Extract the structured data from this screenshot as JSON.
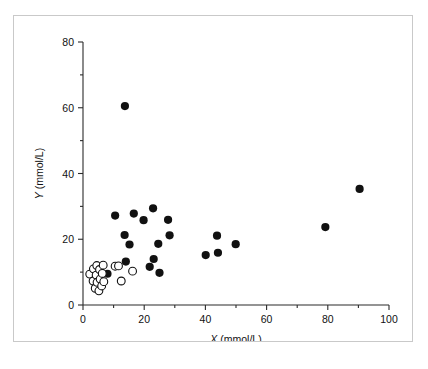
{
  "figure": {
    "border_color": "#c9c9c9",
    "background": "#ffffff"
  },
  "chart_data": {
    "type": "scatter",
    "title": "",
    "xlabel": "X (mmol/L)",
    "ylabel": "Y (mmol/L)",
    "xlabel_var": "X",
    "xlabel_unit": " (mmol/L)",
    "ylabel_var": "Y",
    "ylabel_unit": " (mmol/L)",
    "xlim": [
      0,
      100
    ],
    "ylim": [
      0,
      80
    ],
    "xticks": [
      0,
      20,
      40,
      60,
      80,
      100
    ],
    "yticks": [
      0,
      20,
      40,
      60,
      80
    ],
    "xtick_labels": [
      "0",
      "20",
      "40",
      "60",
      "80",
      "100"
    ],
    "ytick_labels": [
      "0",
      "20",
      "40",
      "60",
      "80"
    ],
    "xminor_ticks": [
      10,
      30,
      50,
      70,
      90
    ],
    "yminor_ticks": [
      10,
      30,
      50,
      70
    ],
    "grid": false,
    "legend": null,
    "marker_colors": {
      "filled": "#111111",
      "open_fill": "#ffffff",
      "open_stroke": "#111111"
    },
    "series": [
      {
        "name": "filled",
        "marker": "filled-circle",
        "points": [
          [
            13.7,
            60.5
          ],
          [
            10.5,
            27.2
          ],
          [
            13.6,
            21.3
          ],
          [
            14.0,
            13.2
          ],
          [
            15.2,
            18.4
          ],
          [
            16.6,
            27.8
          ],
          [
            19.8,
            25.8
          ],
          [
            21.8,
            11.6
          ],
          [
            22.9,
            29.4
          ],
          [
            23.1,
            14.0
          ],
          [
            24.6,
            18.6
          ],
          [
            25.0,
            9.8
          ],
          [
            27.8,
            25.9
          ],
          [
            28.3,
            21.2
          ],
          [
            8.0,
            9.5
          ],
          [
            40.1,
            15.2
          ],
          [
            43.8,
            21.1
          ],
          [
            44.1,
            15.9
          ],
          [
            49.9,
            18.5
          ],
          [
            79.2,
            23.7
          ],
          [
            90.4,
            35.3
          ]
        ]
      },
      {
        "name": "open",
        "marker": "open-circle",
        "points": [
          [
            2.2,
            9.4
          ],
          [
            3.3,
            7.3
          ],
          [
            3.4,
            11.0
          ],
          [
            4.0,
            5.1
          ],
          [
            4.3,
            9.1
          ],
          [
            4.5,
            12.0
          ],
          [
            4.6,
            6.9
          ],
          [
            5.2,
            4.3
          ],
          [
            5.4,
            10.8
          ],
          [
            5.6,
            7.9
          ],
          [
            6.1,
            5.8
          ],
          [
            6.3,
            9.6
          ],
          [
            6.6,
            12.1
          ],
          [
            6.8,
            7.1
          ],
          [
            10.5,
            11.8
          ],
          [
            11.6,
            11.9
          ],
          [
            12.5,
            7.3
          ],
          [
            16.2,
            10.3
          ]
        ]
      }
    ]
  }
}
